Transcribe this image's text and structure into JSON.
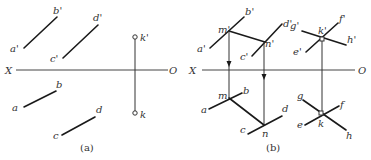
{
  "figure_a": {
    "caption": "(a)",
    "axis": {
      "left_label": "X",
      "right_label": "O"
    },
    "labels": {
      "a_prime": "a'",
      "b_prime": "b'",
      "c_prime": "c'",
      "d_prime": "d'",
      "k_prime": "k'",
      "a": "a",
      "b": "b",
      "c": "c",
      "d": "d",
      "k": "k"
    }
  },
  "figure_b": {
    "caption": "(b)",
    "axis": {
      "left_label": "X",
      "right_label": "O"
    },
    "labels": {
      "a_prime": "a'",
      "b_prime": "b'",
      "c_prime": "c'",
      "d_prime": "d'",
      "m_prime": "m'",
      "n_prime": "n'",
      "g_prime": "g'",
      "f_prime": "f'",
      "k_prime": "k'",
      "h_prime": "h'",
      "e_prime": "e'",
      "a": "a",
      "b": "b",
      "c": "c",
      "d": "d",
      "m": "m",
      "n": "n",
      "g": "g",
      "f": "f",
      "k": "k",
      "h": "h",
      "e": "e"
    }
  },
  "colors": {
    "line": "#1a1a1a",
    "text": "#333333",
    "background": "#ffffff"
  }
}
